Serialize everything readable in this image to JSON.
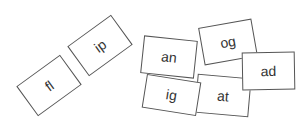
{
  "cards": [
    {
      "label": "fl",
      "cx": 49,
      "cy": 85.5,
      "w": 54,
      "h": 37,
      "angle": -36,
      "z": 1
    },
    {
      "label": "ip",
      "cx": 99.5,
      "cy": 45.5,
      "w": 54,
      "h": 37,
      "angle": -36,
      "z": 1
    },
    {
      "label": "og",
      "cx": 228,
      "cy": 42,
      "w": 54,
      "h": 38,
      "angle": -10,
      "z": 1
    },
    {
      "label": "at",
      "cx": 223,
      "cy": 95,
      "w": 54,
      "h": 39,
      "angle": 5,
      "z": 2
    },
    {
      "label": "ig",
      "cx": 171.5,
      "cy": 95,
      "w": 55,
      "h": 34,
      "angle": 9,
      "z": 3
    },
    {
      "label": "an",
      "cx": 169,
      "cy": 57,
      "w": 54,
      "h": 38,
      "angle": 6,
      "z": 4
    },
    {
      "label": "ad",
      "cx": 268.5,
      "cy": 71,
      "w": 53,
      "h": 38,
      "angle": -1,
      "z": 5
    }
  ],
  "colors": {
    "border": "#555555",
    "text": "#333333",
    "background": "#ffffff"
  }
}
